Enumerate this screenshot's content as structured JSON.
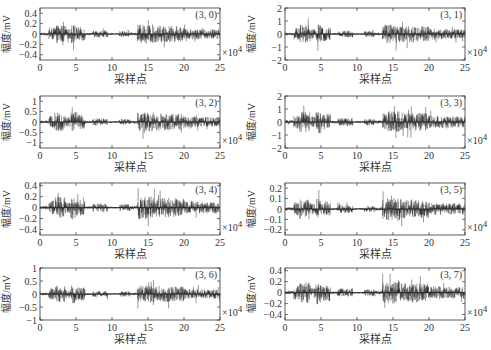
{
  "figure": {
    "layout": {
      "rows": 4,
      "cols": 2
    },
    "x_axis_label": "采样点",
    "y_axis_label": "幅度/mV",
    "x_multiplier": "×10",
    "x_multiplier_exponent": "4",
    "signal_color": "#1a1a1a",
    "axis_color": "#333333"
  },
  "chart_data": [
    {
      "type": "line",
      "title": "(3, 0)",
      "xlabel": "采样点",
      "ylabel": "幅度/mV",
      "x_multiplier": "×10^4",
      "xlim": [
        0,
        25
      ],
      "ylim": [
        -0.5,
        0.5
      ],
      "xticks": [
        0,
        5,
        10,
        15,
        20,
        25
      ],
      "yticks": [
        0.4,
        0.2,
        0,
        -0.2,
        -0.4
      ],
      "ytick_labels": [
        "0.4",
        "0.2",
        "0",
        "−0.2",
        "−0.4"
      ],
      "peak_amplitude": 0.35,
      "annotations": [
        "(3, 0)",
        "×10^4"
      ],
      "grid": false
    },
    {
      "type": "line",
      "title": "(3, 1)",
      "xlabel": "采样点",
      "ylabel": "幅度/mV",
      "x_multiplier": "×10^4",
      "xlim": [
        0,
        25
      ],
      "ylim": [
        -2,
        2
      ],
      "xticks": [
        0,
        5,
        10,
        15,
        20,
        25
      ],
      "yticks": [
        2,
        1,
        0,
        -1,
        -2
      ],
      "ytick_labels": [
        "2",
        "1",
        "0",
        "−1",
        "−2"
      ],
      "peak_amplitude": 1.4,
      "annotations": [
        "(3, 1)",
        "×10^4"
      ],
      "grid": false
    },
    {
      "type": "line",
      "title": "(3, 2)",
      "xlabel": "采样点",
      "ylabel": "幅度/mV",
      "x_multiplier": "×10^4",
      "xlim": [
        0,
        25
      ],
      "ylim": [
        -1.25,
        1.25
      ],
      "xticks": [
        0,
        5,
        10,
        15,
        20,
        25
      ],
      "yticks": [
        1,
        0.5,
        0,
        -0.5,
        -1
      ],
      "ytick_labels": [
        "1",
        "0.5",
        "0",
        "−0.5",
        "−1"
      ],
      "peak_amplitude": 0.9,
      "annotations": [
        "(3, 2)",
        "×10^4"
      ],
      "grid": false
    },
    {
      "type": "line",
      "title": "(3, 3)",
      "xlabel": "采样点",
      "ylabel": "幅度/mV",
      "x_multiplier": "×10^4",
      "xlim": [
        0,
        25
      ],
      "ylim": [
        -2,
        2
      ],
      "xticks": [
        0,
        5,
        10,
        15,
        20,
        25
      ],
      "yticks": [
        2,
        1,
        0,
        -1,
        -2
      ],
      "ytick_labels": [
        "2",
        "1",
        "0",
        "−1",
        "−2"
      ],
      "peak_amplitude": 1.6,
      "annotations": [
        "(3, 3)",
        "×10^4"
      ],
      "grid": false
    },
    {
      "type": "line",
      "title": "(3, 4)",
      "xlabel": "采样点",
      "ylabel": "幅度/mV",
      "x_multiplier": "×10^4",
      "xlim": [
        0,
        25
      ],
      "ylim": [
        -0.5,
        0.45
      ],
      "xticks": [
        0,
        5,
        10,
        15,
        20,
        25
      ],
      "yticks": [
        0.4,
        0.2,
        0,
        -0.2,
        -0.4
      ],
      "ytick_labels": [
        "0.4",
        "0.2",
        "0",
        "−0.2",
        "−0.4"
      ],
      "peak_amplitude": 0.4,
      "annotations": [
        "(3, 4)",
        "×10^4"
      ],
      "grid": false
    },
    {
      "type": "line",
      "title": "(3, 5)",
      "xlabel": "采样点",
      "ylabel": "幅度/mV",
      "x_multiplier": "×10^4",
      "xlim": [
        0,
        25
      ],
      "ylim": [
        -0.25,
        0.25
      ],
      "xticks": [
        0,
        5,
        10,
        15,
        20,
        25
      ],
      "yticks": [
        0.2,
        0.1,
        0,
        -0.1,
        -0.2
      ],
      "ytick_labels": [
        "0.2",
        "0.1",
        "0",
        "−0.1",
        "−0.2"
      ],
      "peak_amplitude": 0.2,
      "annotations": [
        "(3, 5)",
        "×10^4"
      ],
      "grid": false
    },
    {
      "type": "line",
      "title": "(3, 6)",
      "xlabel": "采样点",
      "ylabel": "幅度/mV",
      "x_multiplier": "×10^4",
      "xlim": [
        0,
        25
      ],
      "ylim": [
        -1,
        1
      ],
      "xticks": [
        0,
        5,
        10,
        15,
        20,
        25
      ],
      "yticks": [
        1,
        0.5,
        0,
        -0.5,
        -1
      ],
      "ytick_labels": [
        "1",
        "0.5",
        "0",
        "−0.5",
        "−1"
      ],
      "peak_amplitude": 0.65,
      "annotations": [
        "(3, 6)",
        "×10^4"
      ],
      "grid": false
    },
    {
      "type": "line",
      "title": "(3, 7)",
      "xlabel": "采样点",
      "ylabel": "幅度/mV",
      "x_multiplier": "×10^4",
      "xlim": [
        0,
        25
      ],
      "ylim": [
        -0.5,
        0.45
      ],
      "xticks": [
        0,
        5,
        10,
        15,
        20,
        25
      ],
      "yticks": [
        0.4,
        0.2,
        0,
        -0.2,
        -0.4
      ],
      "ytick_labels": [
        "0.4",
        "0.2",
        "0",
        "−0.2",
        "−0.4"
      ],
      "peak_amplitude": 0.4,
      "annotations": [
        "(3, 7)",
        "×10^4"
      ],
      "grid": false
    }
  ],
  "activity_envelope": [
    [
      0,
      1.2,
      0.15
    ],
    [
      1.2,
      2,
      0.6
    ],
    [
      2,
      3.5,
      0.9
    ],
    [
      3.5,
      4.3,
      0.5
    ],
    [
      4.3,
      5,
      1.0
    ],
    [
      5,
      6.3,
      0.7
    ],
    [
      6.3,
      7.3,
      0.12
    ],
    [
      7.3,
      9.4,
      0.35
    ],
    [
      9.4,
      11,
      0.08
    ],
    [
      11,
      12.5,
      0.3
    ],
    [
      12.5,
      13.5,
      0.15
    ],
    [
      13.5,
      16,
      0.95
    ],
    [
      16,
      18,
      0.85
    ],
    [
      18,
      20,
      0.8
    ],
    [
      20,
      22,
      0.55
    ],
    [
      22,
      25,
      0.5
    ]
  ],
  "panels_layout": [
    {
      "x": 40,
      "y": 8,
      "w": 180,
      "h": 52
    },
    {
      "x": 285,
      "y": 8,
      "w": 180,
      "h": 52
    },
    {
      "x": 40,
      "y": 96,
      "w": 180,
      "h": 52
    },
    {
      "x": 285,
      "y": 96,
      "w": 180,
      "h": 52
    },
    {
      "x": 40,
      "y": 183,
      "w": 180,
      "h": 52
    },
    {
      "x": 285,
      "y": 183,
      "w": 180,
      "h": 52
    },
    {
      "x": 40,
      "y": 268,
      "w": 180,
      "h": 52
    },
    {
      "x": 285,
      "y": 268,
      "w": 180,
      "h": 52
    }
  ]
}
